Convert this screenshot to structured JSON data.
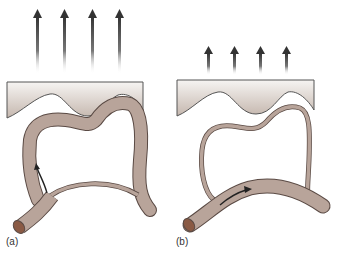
{
  "figure": {
    "panels": [
      {
        "id": "a",
        "label": "(a)",
        "arrows": {
          "count": 4,
          "size": "long",
          "direction": "up"
        },
        "vessel_wall": "thick",
        "flow_arrow_direction": "up-branch"
      },
      {
        "id": "b",
        "label": "(b)",
        "arrows": {
          "count": 4,
          "size": "short",
          "direction": "up"
        },
        "vessel_wall": "thin",
        "flow_arrow_direction": "along-main-vessel"
      }
    ],
    "colors": {
      "vessel_fill": "#b8a49a",
      "vessel_outline": "#5a4a44",
      "vessel_cut_end": "#8a5a44",
      "tissue_top": "#f4f2f0",
      "tissue_bottom": "#c9bcb4",
      "arrow_dark": "#333333",
      "label_text": "#333333"
    }
  }
}
